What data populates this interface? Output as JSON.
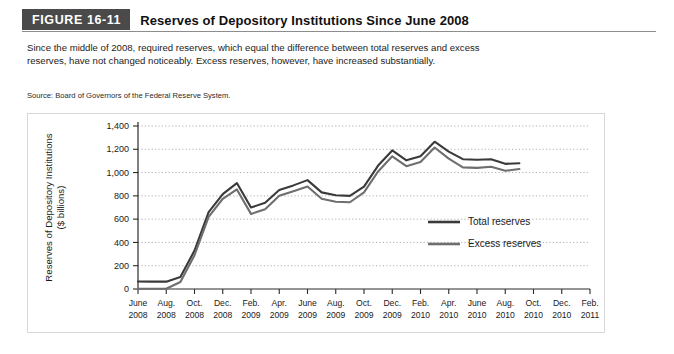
{
  "figure": {
    "badge": "FIGURE 16-11",
    "title": "Reserves of Depository Institutions Since June 2008",
    "caption": "Since the middle of 2008, required reserves, which equal the difference between total reserves and excess reserves, have not changed noticeably. Excess reserves, however, have increased substantially.",
    "source": "Source: Board of Governors of the Federal Reserve System."
  },
  "colors": {
    "badge_background": "#4a4a4a",
    "badge_text": "#ffffff",
    "total_reserves": "#3a3a3a",
    "excess_reserves": "#6e6e6e",
    "gridline": "#9a9a9a",
    "axis": "#2b2b2b"
  },
  "chart_data": {
    "type": "line",
    "title": "Reserves of Depository Institutions Since June 2008",
    "xlabel": "",
    "ylabel": "Reserves of Depository Institutions ($ billions)",
    "ylabel_line1": "Reserves of Depository Institutions",
    "ylabel_line2": "($ billions)",
    "grid": true,
    "legend_position": "center-right",
    "ylim": [
      0,
      1400
    ],
    "ytick_values": [
      0,
      200,
      400,
      600,
      800,
      1000,
      1200,
      1400
    ],
    "ytick_labels": [
      "0",
      "200",
      "400",
      "600",
      "800",
      "1,000",
      "1,200",
      "1,400"
    ],
    "xtick_labels": [
      {
        "month": "June",
        "year": "2008"
      },
      {
        "month": "Aug.",
        "year": "2008"
      },
      {
        "month": "Oct.",
        "year": "2008"
      },
      {
        "month": "Dec.",
        "year": "2008"
      },
      {
        "month": "Feb.",
        "year": "2009"
      },
      {
        "month": "Apr.",
        "year": "2009"
      },
      {
        "month": "June",
        "year": "2009"
      },
      {
        "month": "Aug.",
        "year": "2009"
      },
      {
        "month": "Oct.",
        "year": "2009"
      },
      {
        "month": "Dec.",
        "year": "2009"
      },
      {
        "month": "Feb.",
        "year": "2010"
      },
      {
        "month": "Apr.",
        "year": "2010"
      },
      {
        "month": "June",
        "year": "2010"
      },
      {
        "month": "Aug.",
        "year": "2010"
      },
      {
        "month": "Oct.",
        "year": "2010"
      },
      {
        "month": "Dec.",
        "year": "2010"
      },
      {
        "month": "Feb.",
        "year": "2011"
      }
    ],
    "x_months": [
      "2008-06",
      "2008-07",
      "2008-08",
      "2008-09",
      "2008-10",
      "2008-11",
      "2008-12",
      "2009-01",
      "2009-02",
      "2009-03",
      "2009-04",
      "2009-05",
      "2009-06",
      "2009-07",
      "2009-08",
      "2009-09",
      "2009-10",
      "2009-11",
      "2009-12",
      "2010-01",
      "2010-02",
      "2010-03",
      "2010-04",
      "2010-05",
      "2010-06",
      "2010-07",
      "2010-08",
      "2010-09"
    ],
    "series": [
      {
        "name": "Total reserves",
        "color": "#3a3a3a",
        "values": [
          64,
          63,
          63,
          103,
          330,
          660,
          815,
          910,
          700,
          740,
          850,
          890,
          935,
          830,
          805,
          800,
          880,
          1060,
          1190,
          1105,
          1140,
          1265,
          1180,
          1115,
          1110,
          1115,
          1075,
          1080
        ]
      },
      {
        "name": "Excess reserves",
        "color": "#6e6e6e",
        "values": [
          2,
          2,
          2,
          60,
          290,
          620,
          775,
          855,
          645,
          685,
          800,
          840,
          880,
          775,
          750,
          745,
          830,
          1010,
          1140,
          1055,
          1090,
          1215,
          1120,
          1045,
          1040,
          1050,
          1015,
          1030
        ]
      }
    ]
  },
  "legend": {
    "items": [
      {
        "label": "Total reserves",
        "color": "#3a3a3a"
      },
      {
        "label": "Excess reserves",
        "color": "#6e6e6e"
      }
    ]
  }
}
